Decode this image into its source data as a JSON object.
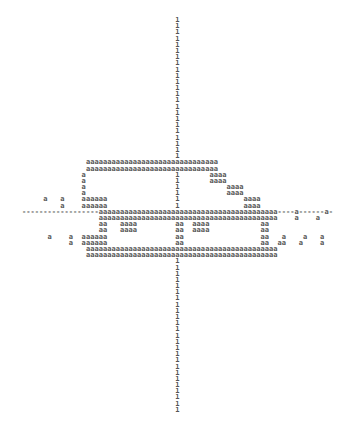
{
  "printout": {
    "description": "ASCII character plot printout",
    "axis_char": "1",
    "fill_char": "a",
    "rows": [
      "                                    1",
      "                                    1",
      "                                    1",
      "                                    1",
      "                                    1",
      "                                    1",
      "                                    1",
      "                                    1",
      "                                    1",
      "                                    1",
      "                                    1",
      "                                    1",
      "                                    1",
      "                                    1",
      "                                    1",
      "                                    1",
      "                                    1",
      "                                    1",
      "                                    1",
      "                                    1",
      "                                    1",
      "                                    1",
      "                                    1",
      "               aaaaaaaaaaaaaaaaaaaaaaaaaaaaaaa",
      "               aaaaaaaaaaaaaaaaaaaaaaaaaaaaaaa",
      "              a                     1       aaaa",
      "              a                     1       aaaa",
      "              a                     1           aaaa",
      "              a                     1           aaaa",
      "     a   a    aaaaaa                1               aaaa",
      "         a    aaaaaa                1               aaaa",
      "------------------aaaaaaaaaaaaaaaaaaaaaaaaaaaaaaaaaaaaaaaaaa----a------a-",
      "                  aaaaaaaaaaaaaaaaaaaaaaaaaaaaaaaaaaaaaaaaaa    a    a",
      "                  aa   aaaa         aa  aaaa            aa",
      "                  aa   aaaa         aa  aaaa            aa",
      "      a    a  aaaaaa                aa                  aa   a    a   a",
      "           a  aaaaaa                aa                  aa  aa   a    a",
      "               aaaaaaaaaaaaaaaaaaaaaaaaaaaaaaaaaaaaaaaaaaaaa",
      "               aaaaaaaaaaaaaaaaaaaaaaaaaaaaaaaaaaaaaaaaaaaaa",
      "                                    1",
      "                                    1",
      "                                    1",
      "                                    1",
      "                                    1",
      "                                    1",
      "                                    1",
      "                                    1",
      "                                    1",
      "                                    1",
      "                                    1",
      "                                    1",
      "                                    1",
      "                                    1",
      "                                    1",
      "                                    1",
      "                                    1",
      "                                    1",
      "                                    1",
      "                                    1",
      "                                    1",
      "                                    1",
      "                                    1",
      "                                    1",
      "                                    1"
    ]
  }
}
